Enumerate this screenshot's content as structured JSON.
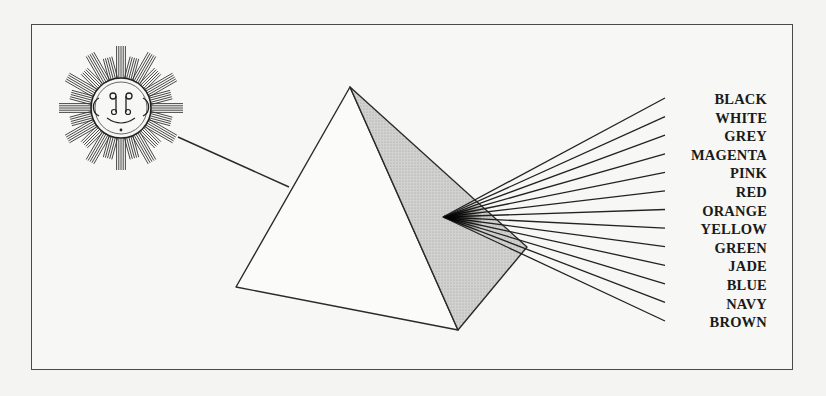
{
  "figure": {
    "title": "",
    "sun": {
      "icon": "sun-face-icon",
      "center": [
        121,
        108
      ],
      "rays": 24
    },
    "incoming_ray": {
      "from": [
        178,
        137
      ],
      "to": [
        289,
        187
      ]
    },
    "prism": {
      "apex": [
        350,
        87
      ],
      "left": [
        236,
        287
      ],
      "bottom": [
        458,
        330
      ],
      "right": [
        527,
        247
      ],
      "shaded_face_color": "#c9c9c7"
    },
    "spectrum": {
      "origin": [
        443,
        217
      ],
      "end_x": 665,
      "end_y_top": 98,
      "end_y_bottom": 321
    },
    "labels": [
      "BLACK",
      "WHITE",
      "GREY",
      "MAGENTA",
      "PINK",
      "RED",
      "ORANGE",
      "YELLOW",
      "GREEN",
      "JADE",
      "BLUE",
      "NAVY",
      "BROWN"
    ]
  }
}
